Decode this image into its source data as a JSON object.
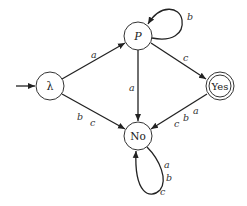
{
  "diagram": {
    "type": "finite-state-automaton",
    "start_state": "lambda",
    "states": [
      {
        "id": "lambda",
        "label": "λ",
        "accepting": false
      },
      {
        "id": "P",
        "label": "P",
        "accepting": false
      },
      {
        "id": "Yes",
        "label": "Yes",
        "accepting": true
      },
      {
        "id": "No",
        "label": "No",
        "accepting": false
      }
    ],
    "transitions": [
      {
        "from": "lambda",
        "to": "P",
        "label": "a"
      },
      {
        "from": "lambda",
        "to": "No",
        "labels": [
          "b",
          "c"
        ]
      },
      {
        "from": "P",
        "to": "P",
        "label": "b"
      },
      {
        "from": "P",
        "to": "No",
        "label": "a"
      },
      {
        "from": "P",
        "to": "Yes",
        "label": "c"
      },
      {
        "from": "Yes",
        "to": "No",
        "labels": [
          "c",
          "b",
          "a"
        ]
      },
      {
        "from": "No",
        "to": "No",
        "labels": [
          "a",
          "b",
          "c"
        ]
      }
    ]
  }
}
